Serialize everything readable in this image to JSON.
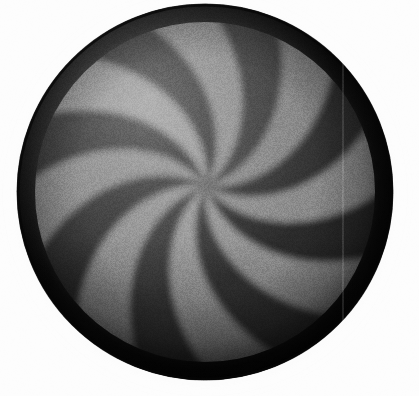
{
  "image": {
    "subject": "macOS spinning wait cursor (beachball / pinwheel) rendered in grayscale",
    "alt_text": "Grayscale spinning pinwheel wait cursor",
    "width": 419,
    "height": 396,
    "background_color": "#fdfdfd"
  },
  "disc": {
    "center_x": 205,
    "center_y": 192,
    "radius": 188,
    "rim_thickness": 19,
    "rim_color_outer": "#0b0b0b",
    "rim_color_inner": "#242424",
    "swirl_center_x": 206,
    "swirl_center_y": 186,
    "sector_count": 16,
    "spoke_pairs": 8,
    "swirl_direction": "counter-clockwise",
    "swirl_twist_degrees": 58
  },
  "palette": {
    "light_sector": "#8c8c8c",
    "light_sector_mid": "#7a7a7a",
    "dark_sector": "#2e2e2e",
    "dark_sector_mid": "#3a3a3a",
    "darkest": "#141414",
    "brightest": "#9a9a9a",
    "glow": "#e2e2e2",
    "shadow": "#aaaaaa"
  },
  "sectors": [
    {
      "index": 0,
      "tone": "light",
      "fill": "#8c8c8c"
    },
    {
      "index": 1,
      "tone": "dark",
      "fill": "#2c2c2c"
    },
    {
      "index": 2,
      "tone": "light",
      "fill": "#848484"
    },
    {
      "index": 3,
      "tone": "dark",
      "fill": "#303030"
    },
    {
      "index": 4,
      "tone": "light",
      "fill": "#7e7e7e"
    },
    {
      "index": 5,
      "tone": "dark",
      "fill": "#2a2a2a"
    },
    {
      "index": 6,
      "tone": "light",
      "fill": "#868686"
    },
    {
      "index": 7,
      "tone": "dark",
      "fill": "#262626"
    },
    {
      "index": 8,
      "tone": "light",
      "fill": "#8e8e8e"
    },
    {
      "index": 9,
      "tone": "dark",
      "fill": "#2e2e2e"
    },
    {
      "index": 10,
      "tone": "light",
      "fill": "#929292"
    },
    {
      "index": 11,
      "tone": "dark",
      "fill": "#323232"
    },
    {
      "index": 12,
      "tone": "light",
      "fill": "#8a8a8a"
    },
    {
      "index": 13,
      "tone": "dark",
      "fill": "#2c2c2c"
    },
    {
      "index": 14,
      "tone": "light",
      "fill": "#828282"
    },
    {
      "index": 15,
      "tone": "dark",
      "fill": "#282828"
    }
  ],
  "lighting": {
    "highlight_x": 150,
    "highlight_y": 120,
    "highlight_radius": 210,
    "highlight_strength": 0.42,
    "vignette_strength": 0.66,
    "bottom_shade_strength": 0.38
  },
  "artifacts": {
    "scan_line_x": 343,
    "grain_opacity": 0.3
  }
}
